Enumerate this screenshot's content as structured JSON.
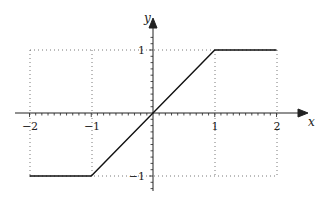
{
  "chart_data": {
    "type": "line",
    "title": "",
    "xlabel": "x",
    "ylabel": "y",
    "xlim": [
      -2,
      2
    ],
    "ylim": [
      -1,
      1
    ],
    "grid": "dotted at integer values",
    "legend": null,
    "x_ticks": [
      "-2",
      "-1",
      "1",
      "2"
    ],
    "y_ticks": [
      "1",
      "-1"
    ],
    "series": [
      {
        "name": "clamp(x, -1, 1)",
        "x": [
          -2,
          -1,
          0,
          1,
          2
        ],
        "y": [
          -1,
          -1,
          0,
          1,
          1
        ]
      }
    ]
  },
  "labels": {
    "x_axis": "x",
    "y_axis": "y",
    "xt_m2": "−2",
    "xt_m1": "−1",
    "xt_1": "1",
    "xt_2": "2",
    "yt_1": "1",
    "yt_m1": "−1"
  }
}
